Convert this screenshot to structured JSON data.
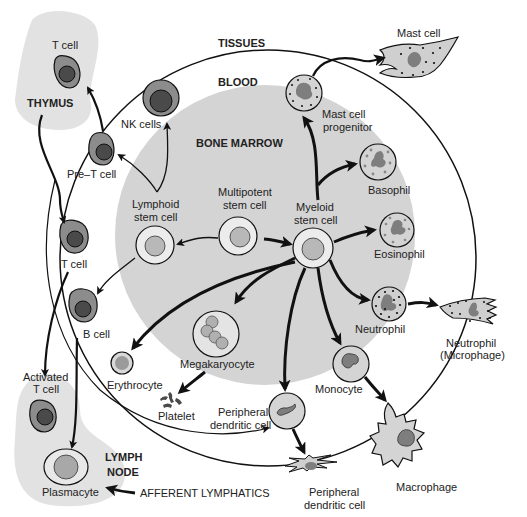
{
  "colors": {
    "background": "#ffffff",
    "marrow": "#d4d4d4",
    "organ": "#e2e2e2",
    "cell_outer": "#8c8c8c",
    "cell_nucleus": "#4a4a4a",
    "stem_outer": "#ececec",
    "stem_nucleus": "#b8b8b8",
    "granulocyte_body": "#cfcfcf",
    "nucleus_gray": "#7e7e7e",
    "stroke": "#111111"
  },
  "regions": {
    "tissues": "TISSUES",
    "blood": "BLOOD",
    "bone_marrow": "BONE MARROW",
    "thymus": "THYMUS",
    "lymph_node_line1": "LYMPH",
    "lymph_node_line2": "NODE",
    "afferent_lymphatics": "AFFERENT LYMPHATICS"
  },
  "cells": {
    "thymus_t_cell": "T cell",
    "nk_cells": "NK cells",
    "pre_t_cell": "Pre–T cell",
    "lymphoid_stem_line1": "Lymphoid",
    "lymphoid_stem_line2": "stem cell",
    "multipotent_line1": "Multipotent",
    "multipotent_line2": "stem cell",
    "myeloid_line1": "Myeloid",
    "myeloid_line2": "stem cell",
    "blood_t_cell": "T cell",
    "b_cell": "B cell",
    "activated_t_line1": "Activated",
    "activated_t_line2": "T cell",
    "plasmacyte": "Plasmacyte",
    "erythrocyte": "Erythrocyte",
    "megakaryocyte": "Megakaryocyte",
    "platelet": "Platelet",
    "peripheral_dc_blood_line1": "Peripheral",
    "peripheral_dc_blood_line2": "dendritic cell",
    "peripheral_dc_tissue_line1": "Peripheral",
    "peripheral_dc_tissue_line2": "dendritic cell",
    "monocyte": "Monocyte",
    "macrophage": "Macrophage",
    "neutrophil": "Neutrophil",
    "neutrophil_tissue_line1": "Neutrophil",
    "neutrophil_tissue_line2": "(Microphage)",
    "eosinophil": "Eosinophil",
    "basophil": "Basophil",
    "mast_progenitor_line1": "Mast cell",
    "mast_progenitor_line2": "progenitor",
    "mast_cell": "Mast cell"
  }
}
